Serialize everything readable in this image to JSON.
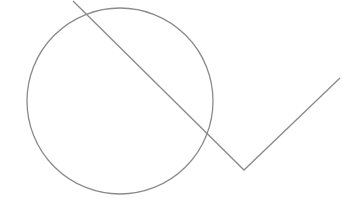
{
  "canvas": {
    "width": 342,
    "height": 203,
    "background": "#ffffff"
  },
  "stroke": {
    "color": "#8a8a8a",
    "width": 1.3
  },
  "shapes": {
    "circle": {
      "cx": 120,
      "cy": 101,
      "r": 93
    },
    "polyline": {
      "points": "73,1 244,170 340,78"
    }
  }
}
